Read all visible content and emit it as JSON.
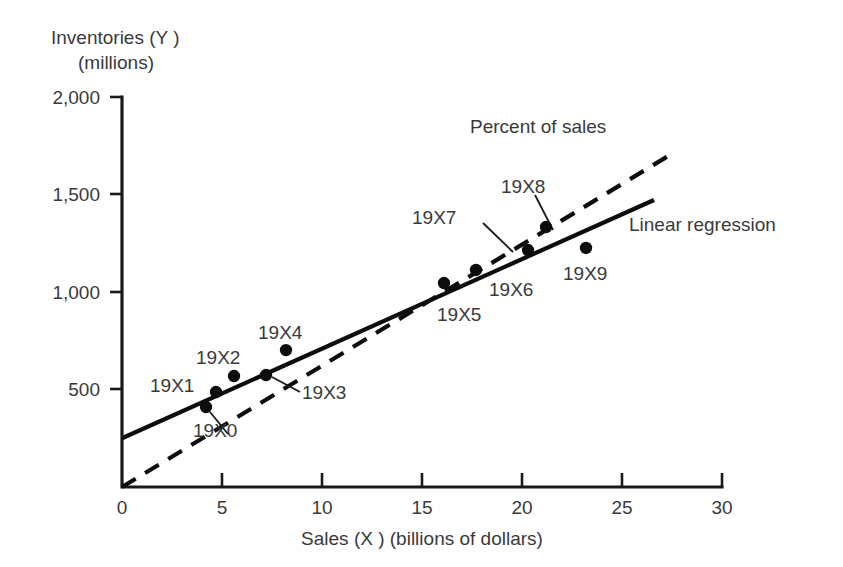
{
  "chart_data": {
    "type": "scatter",
    "title": "",
    "xlabel": "Sales (X ) (billions of dollars)",
    "ylabel_line1": "Inventories (Y )",
    "ylabel_line2": "(millions)",
    "xlim": [
      0,
      30
    ],
    "ylim": [
      0,
      2000
    ],
    "xticks": [
      "0",
      "5",
      "10",
      "15",
      "20",
      "25",
      "30"
    ],
    "xtick_values": [
      0,
      5,
      10,
      15,
      20,
      25,
      30
    ],
    "yticks": [
      "500",
      "1,000",
      "1,500",
      "2,000"
    ],
    "ytick_values": [
      500,
      1000,
      1500,
      2000
    ],
    "grid": false,
    "legend_position": "inline-annotation",
    "points": [
      {
        "label": "19X0",
        "x": 4.2,
        "y": 410
      },
      {
        "label": "19X1",
        "x": 4.7,
        "y": 487
      },
      {
        "label": "19X2",
        "x": 5.6,
        "y": 569
      },
      {
        "label": "19X3",
        "x": 7.2,
        "y": 574
      },
      {
        "label": "19X4",
        "x": 8.2,
        "y": 702
      },
      {
        "label": "19X5",
        "x": 16.1,
        "y": 1046
      },
      {
        "label": "19X6",
        "x": 17.7,
        "y": 1113
      },
      {
        "label": "19X7",
        "x": 20.3,
        "y": 1215
      },
      {
        "label": "19X8",
        "x": 21.2,
        "y": 1333
      },
      {
        "label": "19X9",
        "x": 23.2,
        "y": 1226
      }
    ],
    "series": [
      {
        "name": "Linear regression",
        "style": "solid",
        "x": [
          0,
          26.6
        ],
        "values": [
          250,
          1472
        ]
      },
      {
        "name": "Percent of sales",
        "style": "dashed",
        "x": [
          0,
          27.4
        ],
        "values": [
          0,
          1703
        ]
      }
    ],
    "annotations": [
      {
        "name": "percent-of-sales-label",
        "text": "Percent of sales"
      },
      {
        "name": "linear-regression-label",
        "text": "Linear regression"
      }
    ],
    "colors": {
      "line": "#0d0d0d",
      "axis": "#1a1a1a",
      "text": "#3a3a3a",
      "background": "#ffffff"
    }
  }
}
